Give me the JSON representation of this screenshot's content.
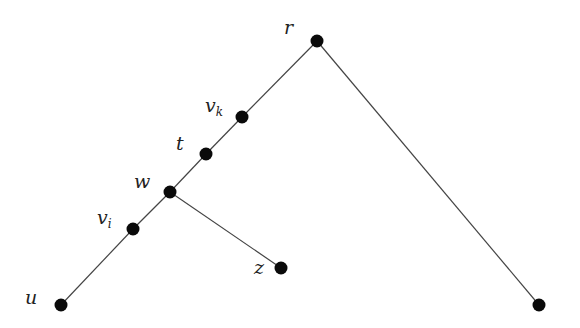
{
  "diagram": {
    "type": "tree",
    "nodes": [
      {
        "id": "r",
        "label": "r",
        "sub": "",
        "x": 317,
        "y": 41,
        "lx": 284,
        "ly": 34
      },
      {
        "id": "vk",
        "label": "v",
        "sub": "k",
        "x": 242,
        "y": 117,
        "lx": 205,
        "ly": 112
      },
      {
        "id": "t",
        "label": "t",
        "sub": "",
        "x": 206,
        "y": 154,
        "lx": 176,
        "ly": 150
      },
      {
        "id": "w",
        "label": "w",
        "sub": "",
        "x": 170,
        "y": 192,
        "lx": 134,
        "ly": 188
      },
      {
        "id": "vi",
        "label": "v",
        "sub": "i",
        "x": 133,
        "y": 229,
        "lx": 97,
        "ly": 224
      },
      {
        "id": "u",
        "label": "u",
        "sub": "",
        "x": 61,
        "y": 305,
        "lx": 25,
        "ly": 304
      },
      {
        "id": "z",
        "label": "z",
        "sub": "",
        "x": 281,
        "y": 268,
        "lx": 254,
        "ly": 274
      },
      {
        "id": "leaf",
        "label": "",
        "sub": "",
        "x": 539,
        "y": 305,
        "lx": 0,
        "ly": 0
      }
    ],
    "edges": [
      [
        "r",
        "vk"
      ],
      [
        "vk",
        "t"
      ],
      [
        "t",
        "w"
      ],
      [
        "w",
        "vi"
      ],
      [
        "vi",
        "u"
      ],
      [
        "w",
        "z"
      ],
      [
        "r",
        "leaf"
      ]
    ]
  }
}
